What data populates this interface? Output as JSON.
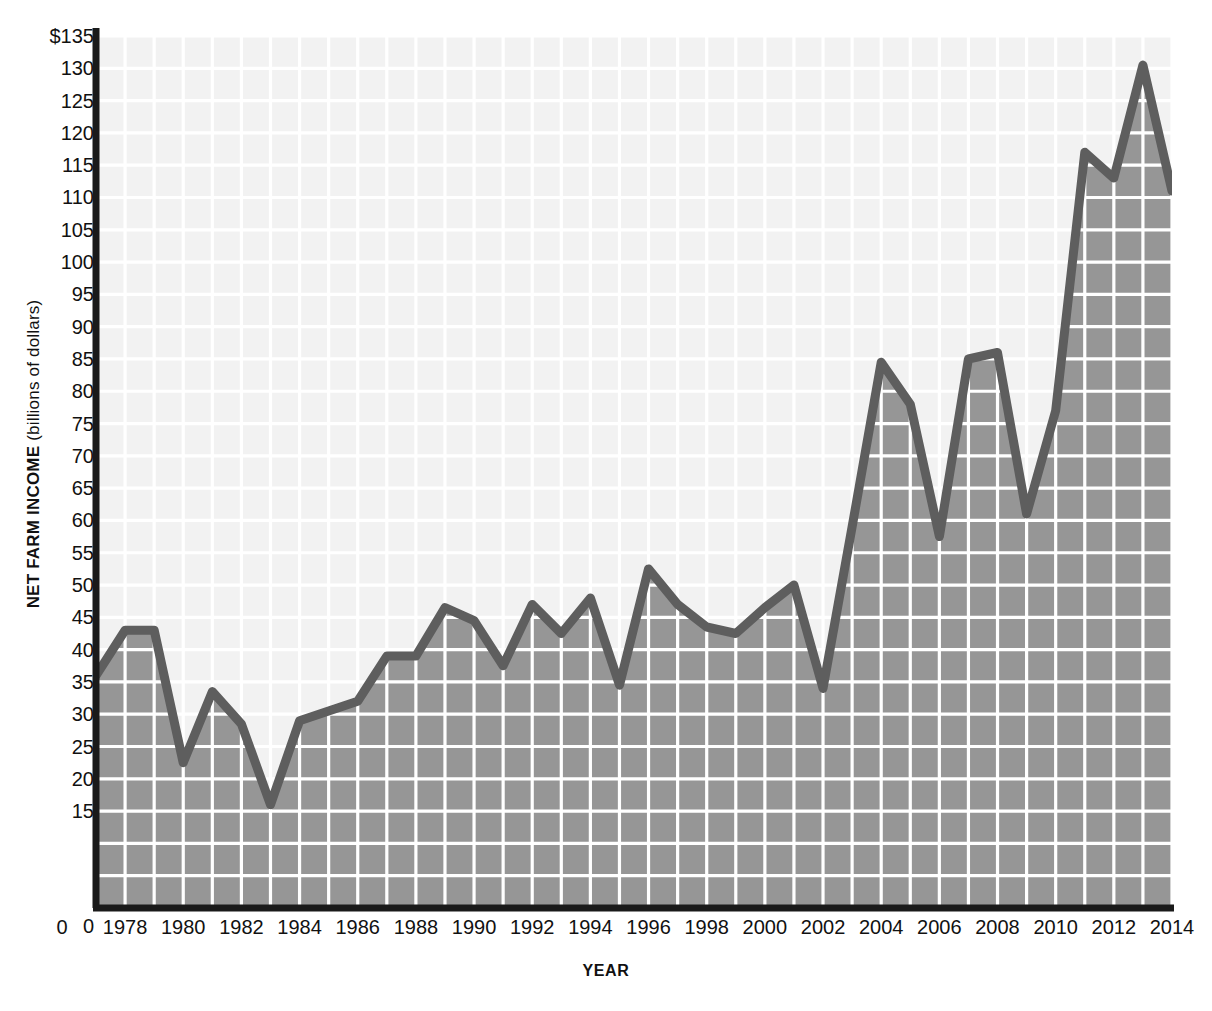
{
  "chart_data": {
    "type": "area",
    "title": "",
    "xlabel": "YEAR",
    "ylabel_main": "NET FARM INCOME",
    "ylabel_sub": " (billions of dollars)",
    "ylabel": "NET FARM INCOME (billions of dollars)",
    "ytick_labels": [
      "$135",
      "130",
      "125",
      "120",
      "115",
      "110",
      "105",
      "100",
      "95",
      "90",
      "85",
      "80",
      "75",
      "70",
      "65",
      "60",
      "55",
      "50",
      "45",
      "40",
      "35",
      "30",
      "25",
      "20",
      "15",
      "0"
    ],
    "ytick_values": [
      135,
      130,
      125,
      120,
      115,
      110,
      105,
      100,
      95,
      90,
      85,
      80,
      75,
      70,
      65,
      60,
      55,
      50,
      45,
      40,
      35,
      30,
      25,
      20,
      15,
      0
    ],
    "ylim": [
      0,
      135
    ],
    "xtick_labels": [
      "0",
      "1978",
      "1980",
      "1982",
      "1984",
      "1986",
      "1988",
      "1990",
      "1992",
      "1994",
      "1996",
      "1998",
      "2000",
      "2002",
      "2004",
      "2006",
      "2008",
      "2010",
      "2012",
      "2014"
    ],
    "xlim": [
      1977,
      2014
    ],
    "grid": true,
    "legend": null,
    "categories": [
      1977,
      1978,
      1979,
      1980,
      1981,
      1982,
      1983,
      1984,
      1985,
      1986,
      1987,
      1988,
      1989,
      1990,
      1991,
      1992,
      1993,
      1994,
      1995,
      1996,
      1997,
      1998,
      1999,
      2000,
      2001,
      2002,
      2003,
      2004,
      2005,
      2006,
      2007,
      2008,
      2009,
      2010,
      2011,
      2012,
      2013,
      2014
    ],
    "values": [
      36,
      43,
      43,
      22.5,
      33.5,
      28.5,
      16,
      29,
      30.5,
      32,
      39,
      39,
      46.5,
      44.5,
      37.5,
      47,
      42.5,
      48,
      34.5,
      52.5,
      47,
      43.5,
      42.5,
      46.5,
      50,
      34,
      59,
      84.5,
      78,
      57.5,
      85,
      86,
      61,
      77,
      117,
      113,
      130.5,
      111
    ],
    "series_name": "Net farm income",
    "line_color": "#5e5e5e",
    "fill_color": "#969696",
    "plot_background": "#f2f2f2",
    "gridline_color": "#ffffff",
    "axis_color": "#1a1a1a"
  }
}
